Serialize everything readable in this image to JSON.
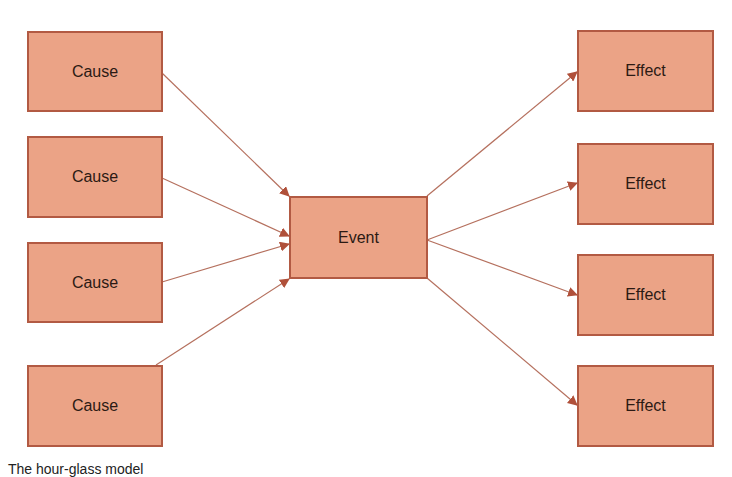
{
  "diagram": {
    "causes": [
      {
        "label": "Cause"
      },
      {
        "label": "Cause"
      },
      {
        "label": "Cause"
      },
      {
        "label": "Cause"
      }
    ],
    "event": {
      "label": "Event"
    },
    "effects": [
      {
        "label": "Effect"
      },
      {
        "label": "Effect"
      },
      {
        "label": "Effect"
      },
      {
        "label": "Effect"
      }
    ],
    "caption": "The hour-glass model"
  },
  "colors": {
    "box_fill": "#eba386",
    "box_border": "#b25a43",
    "arrow": "#b5705e",
    "arrowhead": "#b0503a"
  }
}
